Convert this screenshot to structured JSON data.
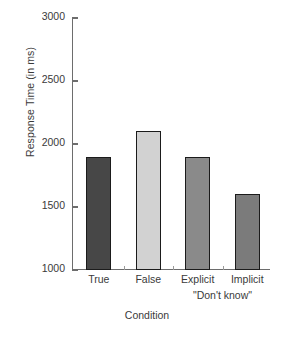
{
  "chart_data": {
    "type": "bar",
    "title": "",
    "xlabel": "Condition",
    "ylabel": "Response Time (in ms)",
    "categories": [
      "True",
      "False",
      "Explicit",
      "Implicit"
    ],
    "values": [
      1900,
      2100,
      1900,
      1600
    ],
    "ylim": [
      1000,
      3000
    ],
    "yticks": [
      1000,
      1500,
      2000,
      2500,
      3000
    ],
    "ytick_labels": [
      "1000",
      "1500",
      "2000",
      "2500",
      "3000"
    ],
    "grid": false,
    "legend": null,
    "annotations": [
      {
        "text": "\"Don't know\"",
        "describes": [
          "Explicit",
          "Implicit"
        ]
      }
    ],
    "bar_colors": [
      "#474747",
      "#d2d2d2",
      "#8a8a8a",
      "#7b7b7b"
    ],
    "bar_edge_color": "#1b1b1b",
    "axis_color": "#6d6d6d",
    "text_color": "#3a3a3a",
    "background": "#ffffff"
  },
  "axis": {
    "y_title": "Response Time (in ms)",
    "x_title": "Condition"
  },
  "group_label": "\"Don't know\""
}
